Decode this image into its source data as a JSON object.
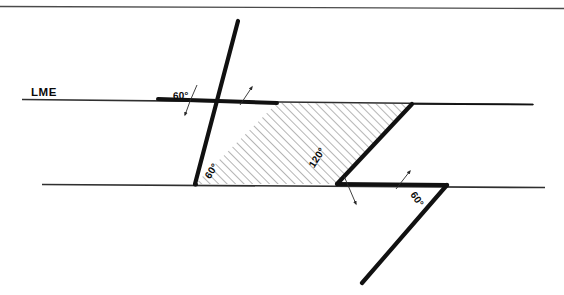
{
  "figure": {
    "canvas": {
      "width": 564,
      "height": 295
    },
    "colors": {
      "ink": "#111111",
      "thin_line": "#3a3a3a",
      "hatch": "#555555",
      "background": "#ffffff",
      "border": "#555555"
    },
    "labels": {
      "line_label": "LME",
      "angle_top_left": "60°",
      "angle_bottom_left": "60°",
      "angle_bottom_middle": "120°",
      "angle_bottom_right": "60°"
    },
    "geometry": {
      "upper_parallel_line": {
        "x1": 22,
        "y1": 99.5,
        "x2": 533,
        "y2": 104.5
      },
      "lower_parallel_line": {
        "x1": 42,
        "y1": 184.5,
        "x2": 545,
        "y2": 187.5
      },
      "upper_ray": {
        "x1": 158,
        "y1": 99,
        "x2": 238,
        "y2": 21
      },
      "lower_ray": {
        "x1": 447,
        "y1": 185,
        "x2": 362,
        "y2": 283
      },
      "parallelogram": [
        {
          "x": 277,
          "y": 103
        },
        {
          "x": 412,
          "y": 104
        },
        {
          "x": 337,
          "y": 184
        },
        {
          "x": 195,
          "y": 184
        }
      ],
      "thick_segment_upper_left": {
        "x1": 158,
        "y1": 99.5,
        "x2": 277,
        "y2": 103
      },
      "thick_segment_lower_right": {
        "x1": 337,
        "y1": 185,
        "x2": 447,
        "y2": 185.5
      },
      "hatch_spacing_px": 4.2,
      "hatch_angle_deg": -45
    },
    "pointers": [
      {
        "name": "pointer-angle-top-left",
        "path": "M 197 85 Q 191 99 186 114",
        "arrow_at": [
          186,
          114
        ],
        "arrow_dir": 110
      },
      {
        "name": "pointer-upper-vertex",
        "path": "M 251 88 Q 245 96 240 104",
        "arrow_at": [
          251,
          88
        ],
        "arrow_dir": -60
      },
      {
        "name": "pointer-angle-bottom-middle",
        "path": "M 345 176 Q 350 190 355 203",
        "arrow_at": [
          355,
          203
        ],
        "arrow_dir": 70
      },
      {
        "name": "pointer-angle-bottom-right",
        "path": "M 409 172 Q 402 180 396 189",
        "arrow_at": [
          409,
          172
        ],
        "arrow_dir": -50
      }
    ],
    "border": {
      "top_rule_y": 6
    }
  }
}
